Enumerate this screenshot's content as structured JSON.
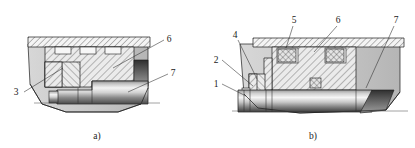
{
  "figure": {
    "type": "engineering-cross-section",
    "background_color": "#ffffff",
    "line_color": "#1b1b1b",
    "subfigures": [
      {
        "id": "a",
        "caption": "a)",
        "caption_x": 97,
        "caption_y": 138,
        "callouts": [
          {
            "label": "3",
            "x": 18,
            "y": 95,
            "leader_to_x": 63,
            "leader_to_y": 68
          },
          {
            "label": "6",
            "x": 168,
            "y": 42,
            "leader_to_x": 113,
            "leader_to_y": 68
          },
          {
            "label": "7",
            "x": 172,
            "y": 76,
            "leader_to_x": 128,
            "leader_to_y": 92
          }
        ]
      },
      {
        "id": "b",
        "caption": "b)",
        "caption_x": 313,
        "caption_y": 138,
        "callouts": [
          {
            "label": "1",
            "x": 216,
            "y": 86,
            "leader_to_x": 246,
            "leader_to_y": 96
          },
          {
            "label": "2",
            "x": 216,
            "y": 62,
            "leader_to_x": 253,
            "leader_to_y": 86
          },
          {
            "label": "4",
            "x": 236,
            "y": 38,
            "leader_to_x": 257,
            "leader_to_y": 79
          },
          {
            "label": "5",
            "x": 295,
            "y": 23,
            "leader_to_x": 286,
            "leader_to_y": 48
          },
          {
            "label": "6",
            "x": 337,
            "y": 23,
            "leader_to_x": 314,
            "leader_to_y": 52
          },
          {
            "label": "7",
            "x": 396,
            "y": 23,
            "leader_to_x": 366,
            "leader_to_y": 88
          }
        ]
      }
    ],
    "colors": {
      "body_fill": "#c9c9c9",
      "hatch_fill": "#e8e8e8",
      "plate_fill": "#f0f0f0",
      "shaft_light": "#f2f2f2",
      "shaft_mid": "#b6b6b6",
      "shaft_dark": "#3c3c3c",
      "seal_fill": "#dcdcdc",
      "line": "#1b1b1b"
    },
    "legend_note": ""
  }
}
